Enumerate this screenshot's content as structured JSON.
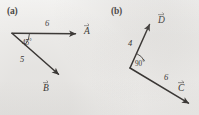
{
  "figure": {
    "type": "vector-diagram",
    "background_color": "#f1f0ee",
    "ink_color": "#33302e",
    "width": 199,
    "height": 115,
    "panels": [
      {
        "id": "a",
        "label": "(a)",
        "origin": {
          "x": 12,
          "y": 33
        },
        "vectors": [
          {
            "name": "A",
            "label": "A",
            "magnitude": "6",
            "direction": "right",
            "angle_from_horizontal_deg": 0,
            "tail": {
              "x": 12,
              "y": 33
            },
            "tip": {
              "x": 80,
              "y": 34
            }
          },
          {
            "name": "B",
            "label": "B",
            "magnitude": "5",
            "direction": "down-right",
            "angle_from_horizontal_deg": -45,
            "tail": {
              "x": 12,
              "y": 33
            },
            "tip": {
              "x": 62,
              "y": 78
            }
          }
        ],
        "angles": [
          {
            "value": "45",
            "unit": "°",
            "text": "45°",
            "between": [
              "A",
              "B"
            ],
            "vertex": {
              "x": 12,
              "y": 33
            }
          }
        ]
      },
      {
        "id": "b",
        "label": "(b)",
        "origin": {
          "x": 130,
          "y": 68
        },
        "vectors": [
          {
            "name": "D",
            "label": "D",
            "magnitude": "4",
            "direction": "up-right",
            "angle_from_horizontal_deg": 66,
            "tail": {
              "x": 130,
              "y": 68
            },
            "tip": {
              "x": 152,
              "y": 19
            }
          },
          {
            "name": "C",
            "label": "C",
            "magnitude": "6",
            "direction": "down-right",
            "angle_from_horizontal_deg": -24,
            "tail": {
              "x": 130,
              "y": 68
            },
            "tip": {
              "x": 193,
              "y": 106
            }
          }
        ],
        "angles": [
          {
            "value": "90",
            "unit": "°",
            "text": "90°",
            "between": [
              "D",
              "C"
            ],
            "vertex": {
              "x": 130,
              "y": 68
            }
          }
        ]
      }
    ]
  },
  "labels": {
    "panel_a": "(a)",
    "panel_b": "(b)",
    "a_magnitude_A": "6",
    "a_magnitude_B": "5",
    "a_angle_value": "45",
    "a_angle_degree_sign": "°",
    "b_magnitude_D": "4",
    "b_magnitude_C": "6",
    "b_angle_value": "90",
    "b_angle_degree_sign": "°",
    "vector_A": "A",
    "vector_B": "B",
    "vector_C": "C",
    "vector_D": "D"
  }
}
